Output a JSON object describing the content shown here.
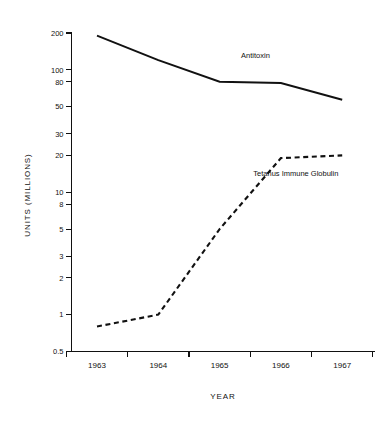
{
  "chart_data": {
    "type": "line",
    "title": "",
    "xlabel": "YEAR",
    "ylabel": "UNITS (MILLIONS)",
    "yscale": "log",
    "ylim": [
      0.5,
      200
    ],
    "grid": false,
    "legend_position": "inline-annotation",
    "categories": [
      "1963",
      "1964",
      "1965",
      "1966",
      "1967"
    ],
    "x_tick_labels": [
      "1963",
      "1964",
      "1965",
      "1966",
      "1967"
    ],
    "y_tick_labels": [
      "0.5",
      "1",
      "2",
      "3",
      "5",
      "8",
      "10",
      "20",
      "30",
      "50",
      "80",
      "100",
      "200"
    ],
    "y_tick_values": [
      0.5,
      1,
      2,
      3,
      5,
      8,
      10,
      20,
      30,
      50,
      80,
      100,
      200
    ],
    "series": [
      {
        "name": "Antitoxin",
        "style": "solid",
        "label": "Antitoxin",
        "values": [
          190,
          120,
          80,
          78,
          57
        ]
      },
      {
        "name": "Tetanus Immune Globulin",
        "style": "dashed",
        "label": "Tetanus Immune Globulin",
        "values": [
          0.8,
          1.0,
          5.0,
          19,
          20
        ]
      }
    ],
    "annotations": [
      {
        "text": "Antitoxin",
        "x": 1965.35,
        "y": 125
      },
      {
        "text": "Tetanus Immune Globulin",
        "x": 1965.55,
        "y": 13.5
      }
    ]
  }
}
